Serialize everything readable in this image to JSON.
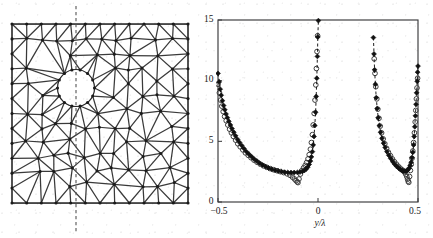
{
  "figure": {
    "panels": [
      {
        "name": "finite-element-mesh",
        "caption": ""
      },
      {
        "name": "field-profile-plot",
        "caption": ""
      }
    ]
  },
  "mesh": {
    "frame": {
      "x": 12,
      "y": 24,
      "width": 176,
      "height": 179
    },
    "hole": {
      "cx": 76,
      "cy": 88,
      "r": 18.5
    },
    "section_line": {
      "x": 76,
      "y_top": 6,
      "y_bottom": 232,
      "style": "dashed"
    },
    "line_color": "#2a2a2a",
    "node_color": "#1b1b1b"
  },
  "chart_data": {
    "type": "scatter",
    "title": "",
    "xlabel": "y/λ",
    "ylabel": "",
    "xlim": [
      -0.5,
      0.5
    ],
    "ylim": [
      0,
      15
    ],
    "xticks": [
      -0.5,
      0,
      0.5
    ],
    "xticklabels": [
      "−0.5",
      "0",
      "0.5"
    ],
    "yticks": [
      0,
      5,
      10,
      15
    ],
    "yticklabels": [
      "0",
      "5",
      "10",
      "15"
    ],
    "grid": false,
    "legend": "none",
    "series": [
      {
        "name": "filled-diamond-series",
        "marker": "filled-diamond",
        "color": "#111111",
        "linestyle": "dashed",
        "points": [
          [
            -0.5,
            10.6
          ],
          [
            -0.494,
            9.9
          ],
          [
            -0.489,
            9.3
          ],
          [
            -0.484,
            8.8
          ],
          [
            -0.478,
            8.35
          ],
          [
            -0.472,
            7.95
          ],
          [
            -0.466,
            7.6
          ],
          [
            -0.46,
            7.25
          ],
          [
            -0.453,
            6.95
          ],
          [
            -0.446,
            6.65
          ],
          [
            -0.438,
            6.35
          ],
          [
            -0.43,
            6.05
          ],
          [
            -0.421,
            5.75
          ],
          [
            -0.412,
            5.45
          ],
          [
            -0.402,
            5.15
          ],
          [
            -0.392,
            4.9
          ],
          [
            -0.381,
            4.65
          ],
          [
            -0.37,
            4.4
          ],
          [
            -0.358,
            4.15
          ],
          [
            -0.346,
            3.95
          ],
          [
            -0.333,
            3.75
          ],
          [
            -0.32,
            3.55
          ],
          [
            -0.306,
            3.38
          ],
          [
            -0.292,
            3.2
          ],
          [
            -0.277,
            3.05
          ],
          [
            -0.262,
            2.92
          ],
          [
            -0.247,
            2.8
          ],
          [
            -0.231,
            2.7
          ],
          [
            -0.215,
            2.62
          ],
          [
            -0.199,
            2.55
          ],
          [
            -0.183,
            2.5
          ],
          [
            -0.167,
            2.46
          ],
          [
            -0.151,
            2.44
          ],
          [
            -0.135,
            2.43
          ],
          [
            -0.119,
            2.43
          ],
          [
            -0.103,
            2.44
          ],
          [
            -0.09,
            2.47
          ],
          [
            -0.078,
            2.52
          ],
          [
            -0.068,
            2.6
          ],
          [
            -0.059,
            2.72
          ],
          [
            -0.051,
            2.88
          ],
          [
            -0.044,
            3.1
          ],
          [
            -0.038,
            3.38
          ],
          [
            -0.033,
            3.72
          ],
          [
            -0.028,
            4.15
          ],
          [
            -0.024,
            4.7
          ],
          [
            -0.02,
            5.4
          ],
          [
            -0.016,
            6.3
          ],
          [
            -0.012,
            7.4
          ],
          [
            -0.009,
            8.7
          ],
          [
            -0.006,
            10.2
          ],
          [
            -0.003,
            12.0
          ],
          [
            -0.001,
            13.6
          ],
          [
            0.002,
            14.95
          ],
          [
            0.277,
            13.55
          ],
          [
            0.28,
            12.2
          ],
          [
            0.283,
            10.9
          ],
          [
            0.287,
            9.7
          ],
          [
            0.291,
            8.6
          ],
          [
            0.296,
            7.7
          ],
          [
            0.301,
            6.95
          ],
          [
            0.307,
            6.3
          ],
          [
            0.313,
            5.75
          ],
          [
            0.32,
            5.25
          ],
          [
            0.328,
            4.85
          ],
          [
            0.336,
            4.5
          ],
          [
            0.345,
            4.15
          ],
          [
            0.354,
            3.85
          ],
          [
            0.364,
            3.58
          ],
          [
            0.374,
            3.32
          ],
          [
            0.384,
            3.1
          ],
          [
            0.394,
            2.92
          ],
          [
            0.404,
            2.78
          ],
          [
            0.413,
            2.66
          ],
          [
            0.422,
            2.58
          ],
          [
            0.43,
            2.54
          ],
          [
            0.437,
            2.54
          ],
          [
            0.444,
            2.58
          ],
          [
            0.45,
            2.66
          ],
          [
            0.456,
            2.8
          ],
          [
            0.461,
            3.0
          ],
          [
            0.466,
            3.28
          ],
          [
            0.47,
            3.65
          ],
          [
            0.474,
            4.1
          ],
          [
            0.478,
            4.7
          ],
          [
            0.481,
            5.4
          ],
          [
            0.484,
            6.2
          ],
          [
            0.487,
            7.1
          ],
          [
            0.49,
            8.05
          ],
          [
            0.493,
            9.0
          ],
          [
            0.496,
            9.95
          ],
          [
            0.498,
            10.7
          ],
          [
            0.5,
            11.2
          ]
        ]
      },
      {
        "name": "open-circle-series",
        "marker": "open-circle",
        "color": "#3d3d3d",
        "linestyle": "none",
        "points": [
          [
            -0.5,
            9.7
          ],
          [
            -0.493,
            9.0
          ],
          [
            -0.487,
            8.4
          ],
          [
            -0.481,
            7.9
          ],
          [
            -0.474,
            7.45
          ],
          [
            -0.467,
            7.05
          ],
          [
            -0.459,
            6.7
          ],
          [
            -0.451,
            6.35
          ],
          [
            -0.442,
            6.0
          ],
          [
            -0.433,
            5.7
          ],
          [
            -0.423,
            5.4
          ],
          [
            -0.412,
            5.1
          ],
          [
            -0.401,
            4.8
          ],
          [
            -0.389,
            4.55
          ],
          [
            -0.376,
            4.3
          ],
          [
            -0.363,
            4.05
          ],
          [
            -0.349,
            3.85
          ],
          [
            -0.335,
            3.65
          ],
          [
            -0.32,
            3.45
          ],
          [
            -0.305,
            3.28
          ],
          [
            -0.289,
            3.12
          ],
          [
            -0.273,
            2.98
          ],
          [
            -0.256,
            2.86
          ],
          [
            -0.239,
            2.75
          ],
          [
            -0.222,
            2.66
          ],
          [
            -0.205,
            2.58
          ],
          [
            -0.188,
            2.5
          ],
          [
            -0.171,
            2.42
          ],
          [
            -0.154,
            2.32
          ],
          [
            -0.14,
            2.2
          ],
          [
            -0.128,
            2.05
          ],
          [
            -0.118,
            1.9
          ],
          [
            -0.11,
            1.76
          ],
          [
            -0.104,
            1.66
          ],
          [
            -0.1,
            1.6
          ],
          [
            -0.095,
            1.9
          ],
          [
            -0.088,
            2.3
          ],
          [
            -0.08,
            2.6
          ],
          [
            -0.072,
            2.82
          ],
          [
            -0.064,
            3.02
          ],
          [
            -0.057,
            3.25
          ],
          [
            -0.05,
            3.55
          ],
          [
            -0.044,
            3.9
          ],
          [
            -0.038,
            4.35
          ],
          [
            -0.033,
            4.9
          ],
          [
            -0.028,
            5.55
          ],
          [
            -0.024,
            6.35
          ],
          [
            -0.019,
            7.3
          ],
          [
            -0.015,
            8.4
          ],
          [
            -0.011,
            9.65
          ],
          [
            -0.008,
            11.0
          ],
          [
            -0.005,
            12.4
          ],
          [
            -0.002,
            13.7
          ],
          [
            0.281,
            11.8
          ],
          [
            0.285,
            10.6
          ],
          [
            0.289,
            9.5
          ],
          [
            0.294,
            8.5
          ],
          [
            0.299,
            7.65
          ],
          [
            0.305,
            6.9
          ],
          [
            0.311,
            6.25
          ],
          [
            0.318,
            5.7
          ],
          [
            0.326,
            5.2
          ],
          [
            0.334,
            4.8
          ],
          [
            0.343,
            4.42
          ],
          [
            0.352,
            4.1
          ],
          [
            0.362,
            3.82
          ],
          [
            0.372,
            3.55
          ],
          [
            0.382,
            3.32
          ],
          [
            0.392,
            3.12
          ],
          [
            0.401,
            2.95
          ],
          [
            0.41,
            2.8
          ],
          [
            0.418,
            2.68
          ],
          [
            0.426,
            2.58
          ],
          [
            0.433,
            2.45
          ],
          [
            0.439,
            2.28
          ],
          [
            0.444,
            2.08
          ],
          [
            0.448,
            1.88
          ],
          [
            0.451,
            1.72
          ],
          [
            0.454,
            1.62
          ],
          [
            0.458,
            2.1
          ],
          [
            0.462,
            2.6
          ],
          [
            0.466,
            3.1
          ],
          [
            0.47,
            3.6
          ],
          [
            0.474,
            4.2
          ],
          [
            0.478,
            4.9
          ],
          [
            0.482,
            5.7
          ],
          [
            0.486,
            6.6
          ],
          [
            0.489,
            7.55
          ],
          [
            0.492,
            8.5
          ],
          [
            0.495,
            9.4
          ],
          [
            0.498,
            10.2
          ]
        ]
      }
    ]
  }
}
